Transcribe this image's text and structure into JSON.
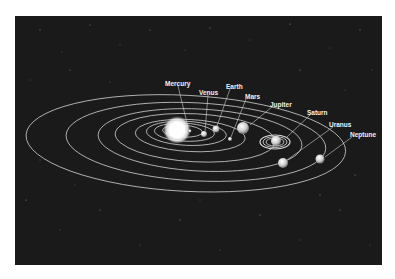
{
  "diagram": {
    "type": "solar-system-orbits",
    "background_color": "#1a1a1a",
    "orbit_color": "#d8d8d8",
    "sun": {
      "label": "Sun"
    },
    "planets": [
      {
        "name": "Mercury"
      },
      {
        "name": "Venus"
      },
      {
        "name": "Earth"
      },
      {
        "name": "Mars"
      },
      {
        "name": "Jupiter"
      },
      {
        "name": "Saturn"
      },
      {
        "name": "Uranus"
      },
      {
        "name": "Neptune"
      }
    ]
  }
}
